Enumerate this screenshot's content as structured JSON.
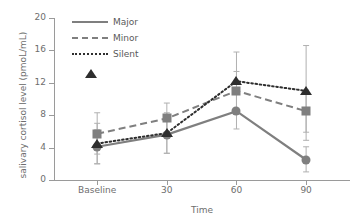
{
  "chart_data": {
    "type": "line",
    "title": "",
    "xlabel": "Time",
    "ylabel": "salivary cortisol level (pmoL/mL)",
    "categories": [
      "Baseline",
      "30",
      "60",
      "90"
    ],
    "ylim": [
      0,
      20
    ],
    "yticks": [
      0,
      4,
      8,
      12,
      16,
      20
    ],
    "grid": false,
    "legend_position": "top-left",
    "error_bars": "SD",
    "series": [
      {
        "name": "Major",
        "marker": "circle",
        "linestyle": "solid",
        "color": "#7f7f7f",
        "values": [
          4.1,
          5.6,
          8.5,
          2.5
        ],
        "err_low": [
          2.0,
          3.3,
          6.3,
          1.0
        ],
        "err_high": [
          6.2,
          7.7,
          10.7,
          4.1
        ]
      },
      {
        "name": "Minor",
        "marker": "square",
        "linestyle": "dashed",
        "color": "#7f7f7f",
        "values": [
          5.7,
          7.6,
          11.0,
          8.5
        ],
        "err_low": [
          3.2,
          5.6,
          8.6,
          5.9
        ],
        "err_high": [
          8.3,
          9.5,
          13.4,
          11.1
        ]
      },
      {
        "name": "Silent",
        "marker": "triangle",
        "linestyle": "dotted",
        "color": "#2e2e2e",
        "values": [
          4.5,
          5.8,
          12.2,
          11.0
        ],
        "err_low": [
          2.0,
          3.3,
          8.5,
          4.9
        ],
        "err_high": [
          7.0,
          8.3,
          15.8,
          16.6
        ]
      }
    ]
  },
  "legend": {
    "items": [
      {
        "label": "Major"
      },
      {
        "label": "Minor"
      },
      {
        "label": "Silent"
      }
    ]
  },
  "axes": {
    "y_title": "salivary cortisol level (pmoL/mL)",
    "x_title": "Time",
    "y_tick_labels": [
      "0",
      "4",
      "8",
      "12",
      "16",
      "20"
    ],
    "x_tick_labels": [
      "Baseline",
      "30",
      "60",
      "90"
    ]
  },
  "colors": {
    "gray_series": "#7f7f7f",
    "dark_series": "#2e2e2e",
    "axis": "#9a9a9a",
    "text": "#6e6e6e",
    "background": "#ffffff"
  }
}
